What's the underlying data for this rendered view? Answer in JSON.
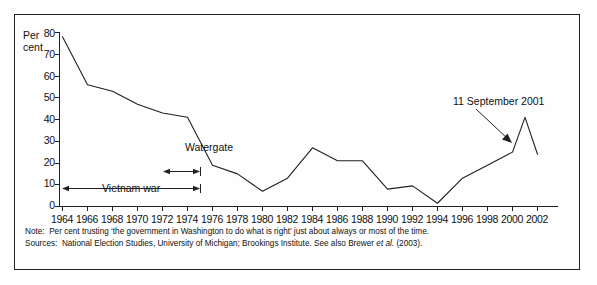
{
  "chart_data": {
    "type": "line",
    "title": "",
    "xlabel": "",
    "ylabel": "Per cent",
    "ylim": [
      0,
      80
    ],
    "xlim": [
      1964,
      2003
    ],
    "grid": false,
    "legend": "none",
    "x": [
      1964,
      1966,
      1968,
      1970,
      1972,
      1974,
      1976,
      1978,
      1980,
      1982,
      1984,
      1986,
      1988,
      1990,
      1992,
      1994,
      1996,
      1998,
      2000,
      2001,
      2002
    ],
    "values": [
      78,
      56,
      53,
      47,
      43,
      41,
      19,
      15,
      7,
      13,
      27,
      21,
      21,
      8,
      9.5,
      1.5,
      13,
      19,
      25,
      41,
      24
    ],
    "series": [
      {
        "name": "Per cent trusting the government in Washington",
        "values": [
          78,
          56,
          53,
          47,
          43,
          41,
          19,
          15,
          7,
          13,
          27,
          21,
          21,
          8,
          9.5,
          1.5,
          13,
          19,
          25,
          41,
          24
        ]
      }
    ],
    "y_ticks": [
      0,
      10,
      20,
      30,
      40,
      50,
      60,
      70,
      80
    ],
    "x_ticks": [
      1964,
      1966,
      1968,
      1970,
      1972,
      1974,
      1976,
      1978,
      1980,
      1982,
      1984,
      1986,
      1988,
      1990,
      1992,
      1994,
      1996,
      1998,
      2000,
      2002
    ],
    "line_color": "#231f20",
    "annotations": [
      {
        "id": "watergate",
        "label": "Watergate",
        "type": "text"
      },
      {
        "id": "sept11",
        "label": "11 September 2001",
        "type": "text-with-arrow"
      },
      {
        "id": "vietnam-war",
        "label": "Vietnam war",
        "type": "span-bracket",
        "from": 1964,
        "to": 1975
      },
      {
        "id": "watergate-span",
        "label": "",
        "type": "span-bracket",
        "from": 1972,
        "to": 1975
      }
    ]
  },
  "axes": {
    "y_title_line1": "Per",
    "y_title_line2": "cent",
    "y_tick_labels": [
      "80",
      "70",
      "60",
      "50",
      "40",
      "30",
      "20",
      "10",
      "0"
    ],
    "x_tick_labels": [
      "1964",
      "1966",
      "1968",
      "1970",
      "1972",
      "1974",
      "1976",
      "1978",
      "1980",
      "1982",
      "1984",
      "1986",
      "1988",
      "1990",
      "1992",
      "1994",
      "1996",
      "1998",
      "2000",
      "2002"
    ]
  },
  "annotations": {
    "watergate": "Watergate",
    "sept11": "11 September 2001",
    "vietnam_war": "Vietnam war"
  },
  "footnotes": {
    "note_tag": "Note:",
    "note_text": "Per cent trusting ‘the government in Washington to do what is right’ just about always or most of the time.",
    "sources_tag": "Sources:",
    "sources_text_part1": "National Election Studies, University of Michigan; Brookings Institute. See also Brewer ",
    "sources_text_italic": "et al.",
    "sources_text_part2": " (2003)."
  },
  "colors": {
    "line": "#231f20",
    "axis": "#231f20",
    "frame": "#231f20",
    "text": "#111111",
    "background": "#ffffff"
  }
}
